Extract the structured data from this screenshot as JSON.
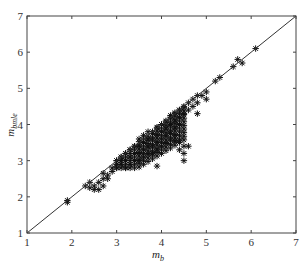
{
  "chart_data": {
    "type": "scatter",
    "title": "",
    "xlabel": "m_b",
    "xlabel_main": "m",
    "xlabel_sub": "b",
    "ylabel": "m_bmle",
    "ylabel_main": "m",
    "ylabel_sub": "bmle",
    "xlim": [
      1,
      7
    ],
    "ylim": [
      1,
      7
    ],
    "xticks": [
      "1",
      "2",
      "3",
      "4",
      "5",
      "6",
      "7"
    ],
    "yticks": [
      "1",
      "2",
      "3",
      "4",
      "5",
      "6",
      "7"
    ],
    "grid": false,
    "legend": null,
    "marker": "asterisk",
    "reference_line": {
      "label": "y = x",
      "from": [
        1,
        1
      ],
      "to": [
        7,
        7
      ]
    },
    "series": [
      {
        "name": "estimates",
        "points": [
          [
            1.9,
            1.85
          ],
          [
            1.9,
            1.9
          ],
          [
            2.3,
            2.3
          ],
          [
            2.4,
            2.4
          ],
          [
            2.5,
            2.3
          ],
          [
            2.4,
            2.25
          ],
          [
            2.5,
            2.2
          ],
          [
            2.6,
            2.2
          ],
          [
            2.7,
            2.3
          ],
          [
            2.7,
            2.5
          ],
          [
            2.6,
            2.4
          ],
          [
            2.8,
            2.5
          ],
          [
            2.8,
            2.6
          ],
          [
            2.7,
            2.65
          ],
          [
            2.9,
            2.7
          ],
          [
            2.9,
            2.8
          ],
          [
            3.0,
            2.8
          ],
          [
            3.0,
            2.9
          ],
          [
            3.0,
            3.0
          ],
          [
            3.1,
            2.9
          ],
          [
            3.1,
            3.0
          ],
          [
            3.1,
            3.1
          ],
          [
            3.2,
            2.8
          ],
          [
            3.2,
            3.0
          ],
          [
            3.2,
            3.2
          ],
          [
            3.3,
            2.9
          ],
          [
            3.3,
            3.1
          ],
          [
            3.3,
            3.3
          ],
          [
            3.4,
            3.0
          ],
          [
            3.4,
            3.2
          ],
          [
            3.4,
            3.4
          ],
          [
            3.5,
            3.0
          ],
          [
            3.5,
            3.2
          ],
          [
            3.5,
            3.4
          ],
          [
            3.5,
            3.6
          ],
          [
            3.6,
            3.1
          ],
          [
            3.6,
            3.3
          ],
          [
            3.6,
            3.5
          ],
          [
            3.6,
            3.7
          ],
          [
            3.7,
            3.2
          ],
          [
            3.7,
            3.4
          ],
          [
            3.7,
            3.6
          ],
          [
            3.7,
            3.8
          ],
          [
            3.8,
            3.2
          ],
          [
            3.8,
            3.4
          ],
          [
            3.8,
            3.6
          ],
          [
            3.8,
            3.8
          ],
          [
            3.9,
            3.3
          ],
          [
            3.9,
            3.5
          ],
          [
            3.9,
            3.7
          ],
          [
            3.9,
            3.9
          ],
          [
            4.0,
            3.4
          ],
          [
            4.0,
            3.6
          ],
          [
            4.0,
            3.8
          ],
          [
            4.0,
            4.0
          ],
          [
            4.1,
            3.5
          ],
          [
            4.1,
            3.7
          ],
          [
            4.1,
            3.9
          ],
          [
            4.1,
            4.1
          ],
          [
            4.2,
            3.6
          ],
          [
            4.2,
            3.8
          ],
          [
            4.2,
            4.0
          ],
          [
            4.2,
            4.2
          ],
          [
            4.3,
            3.7
          ],
          [
            4.3,
            3.9
          ],
          [
            4.3,
            4.1
          ],
          [
            4.3,
            4.3
          ],
          [
            4.4,
            4.0
          ],
          [
            4.4,
            4.2
          ],
          [
            4.4,
            4.4
          ],
          [
            4.5,
            4.3
          ],
          [
            4.5,
            4.5
          ],
          [
            4.6,
            4.4
          ],
          [
            4.6,
            4.6
          ],
          [
            4.7,
            4.5
          ],
          [
            4.7,
            4.7
          ],
          [
            4.8,
            4.6
          ],
          [
            4.8,
            4.8
          ],
          [
            4.9,
            4.8
          ],
          [
            5.0,
            4.9
          ],
          [
            5.0,
            4.7
          ],
          [
            5.2,
            5.2
          ],
          [
            5.3,
            5.3
          ],
          [
            5.6,
            5.6
          ],
          [
            5.8,
            5.7
          ],
          [
            5.7,
            5.8
          ],
          [
            6.1,
            6.1
          ],
          [
            3.9,
            2.85
          ],
          [
            4.4,
            3.55
          ],
          [
            4.4,
            3.3
          ],
          [
            4.5,
            3.4
          ],
          [
            4.5,
            3.2
          ],
          [
            4.5,
            3.0
          ],
          [
            4.6,
            3.4
          ],
          [
            4.8,
            4.3
          ],
          [
            4.3,
            3.55
          ]
        ]
      }
    ]
  }
}
